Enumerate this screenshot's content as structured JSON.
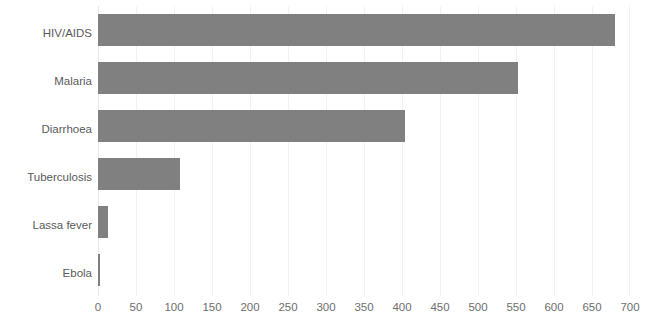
{
  "chart_data": {
    "type": "bar",
    "orientation": "horizontal",
    "title": "",
    "subtitle": "",
    "xlabel": "",
    "ylabel": "",
    "xlim": [
      0,
      700
    ],
    "x_ticks": [
      0,
      50,
      100,
      150,
      200,
      250,
      300,
      350,
      400,
      450,
      500,
      550,
      600,
      650,
      700
    ],
    "x_tick_labels": [
      "0",
      "50",
      "100",
      "150",
      "200",
      "250",
      "300",
      "350",
      "400",
      "450",
      "500",
      "550",
      "600",
      "650",
      "700"
    ],
    "grid": true,
    "grid_axis": "x",
    "legend": false,
    "legend_position": "none",
    "bar_color": "#808080",
    "grid_color": "#f2f2f2",
    "label_color": "#5a5a5a",
    "tick_color": "#6e6e6e",
    "categories": [
      "HIV/AIDS",
      "Malaria",
      "Diarrhoea",
      "Tuberculosis",
      "Lassa fever",
      "Ebola"
    ],
    "values": [
      680,
      552,
      404,
      108,
      13,
      3
    ],
    "series": [
      {
        "name": "",
        "values": [
          680,
          552,
          404,
          108,
          13,
          3
        ]
      }
    ]
  }
}
